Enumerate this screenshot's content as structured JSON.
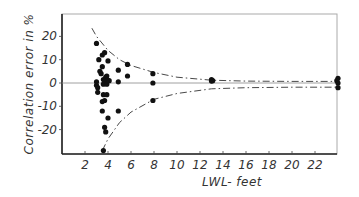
{
  "chart_data": {
    "type": "scatter",
    "title": "",
    "xlabel": "LWL- feet",
    "ylabel": "Correlation error in %",
    "xlim": [
      0,
      24
    ],
    "ylim": [
      -30,
      30
    ],
    "x_ticks": [
      2,
      4,
      6,
      8,
      10,
      12,
      14,
      16,
      18,
      20,
      22
    ],
    "y_ticks": [
      20,
      10,
      0,
      -10,
      -20
    ],
    "grid": false,
    "reference_line": {
      "y": 0,
      "style": "solid-thin"
    },
    "envelope": {
      "upper": [
        [
          2.6,
          23.5
        ],
        [
          3,
          20
        ],
        [
          4,
          14
        ],
        [
          5,
          10
        ],
        [
          6,
          7.5
        ],
        [
          8,
          4.5
        ],
        [
          10,
          2.5
        ],
        [
          13,
          1.2
        ],
        [
          16,
          0.8
        ],
        [
          20,
          0.7
        ],
        [
          24,
          0.7
        ]
      ],
      "lower": [
        [
          3.5,
          -29
        ],
        [
          4,
          -24
        ],
        [
          5,
          -17
        ],
        [
          6,
          -12.5
        ],
        [
          8,
          -7
        ],
        [
          10,
          -4.5
        ],
        [
          13,
          -2.5
        ],
        [
          16,
          -2
        ],
        [
          20,
          -1.8
        ],
        [
          24,
          -1.8
        ]
      ],
      "style": "dash-dot"
    },
    "series": [
      {
        "name": "measurements",
        "points": [
          [
            3.0,
            17
          ],
          [
            3.2,
            10
          ],
          [
            3.5,
            12
          ],
          [
            3.7,
            13
          ],
          [
            3.3,
            5
          ],
          [
            3.5,
            7
          ],
          [
            4.0,
            9.5
          ],
          [
            3.4,
            4
          ],
          [
            3.6,
            1.5
          ],
          [
            3.8,
            2.5
          ],
          [
            3.9,
            3
          ],
          [
            4.0,
            1
          ],
          [
            3.7,
            0.5
          ],
          [
            3.0,
            -1
          ],
          [
            3.0,
            0.5
          ],
          [
            3.1,
            -2
          ],
          [
            3.6,
            -0.5
          ],
          [
            3.9,
            -0.5
          ],
          [
            4.1,
            1
          ],
          [
            3.1,
            -4
          ],
          [
            3.6,
            -5
          ],
          [
            3.9,
            -5
          ],
          [
            3.5,
            -8
          ],
          [
            3.7,
            -7.5
          ],
          [
            3.5,
            -12
          ],
          [
            4.0,
            -15
          ],
          [
            4.9,
            -12
          ],
          [
            3.7,
            -19
          ],
          [
            3.8,
            -21
          ],
          [
            3.6,
            -29
          ],
          [
            4.9,
            5.5
          ],
          [
            4.9,
            0.5
          ],
          [
            5.7,
            8
          ],
          [
            5.7,
            3
          ],
          [
            7.9,
            4
          ],
          [
            7.9,
            0
          ],
          [
            7.9,
            -7.5
          ],
          [
            13.0,
            1.5
          ],
          [
            13.1,
            1
          ],
          [
            13.0,
            0.8
          ],
          [
            24.0,
            2
          ],
          [
            23.9,
            1
          ],
          [
            24.0,
            0
          ],
          [
            24.0,
            -2
          ]
        ]
      }
    ]
  }
}
